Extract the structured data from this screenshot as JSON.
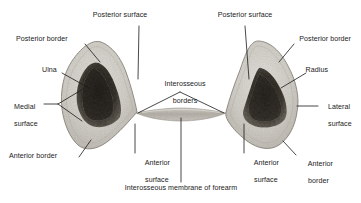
{
  "figure": {
    "background_color": "#ffffff",
    "leader_line_color": "#1b1b1b",
    "bone_cortex_color": "#cfccc6",
    "bone_cortex_edge_color": "#9a958d",
    "bone_marrow_color": "#3a362f",
    "membrane_color": "#b9b5ad"
  },
  "labels": {
    "posterior_surface_left": "Posterior surface",
    "posterior_border_left": "Posterior border",
    "ulna": "Ulna",
    "medial_surface_line1": "Medial",
    "medial_surface_line2": "surface",
    "anterior_border_left": "Anterior border",
    "anterior_surface_left_line1": "Anterior",
    "anterior_surface_left_line2": "surface",
    "interosseous_borders_line1": "Interosseous",
    "interosseous_borders_line2": "borders",
    "interosseous_membrane": "Interosseous membrane of forearm",
    "posterior_surface_right": "Posterior surface",
    "posterior_border_right": "Posterior border",
    "radius": "Radius",
    "lateral_surface_line1": "Lateral",
    "lateral_surface_line2": "surface",
    "anterior_border_right_line1": "Anterior",
    "anterior_border_right_line2": "border",
    "anterior_surface_right_line1": "Anterior",
    "anterior_surface_right_line2": "surface"
  }
}
